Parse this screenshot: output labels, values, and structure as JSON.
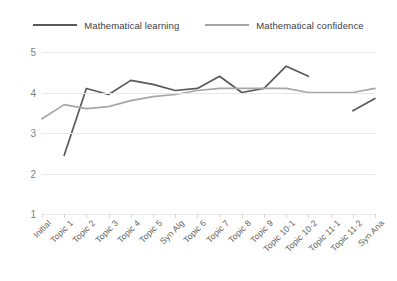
{
  "legend": {
    "position": "top-center",
    "items": [
      {
        "label": "Mathematical learning",
        "color": "#595959",
        "name": "legend-mathematical-learning"
      },
      {
        "label": "Mathematical confidence",
        "color": "#a6a6a6",
        "name": "legend-mathematical-confidence"
      }
    ]
  },
  "chart_data": {
    "type": "line",
    "title": "",
    "xlabel": "",
    "ylabel": "",
    "ylim": [
      1,
      5
    ],
    "yticks": [
      1,
      2,
      3,
      4,
      5
    ],
    "grid": true,
    "categories": [
      "Initial",
      "Topic 1",
      "Topic 2",
      "Topic 3",
      "Topic 4",
      "Topic 5",
      "Syn Alg",
      "Topic 6",
      "Topic 7",
      "Topic 8",
      "Topic 9",
      "Topic 10-1",
      "Topic 10-2",
      "Topic 11-1",
      "Topic 11-2",
      "Syn Ana"
    ],
    "series": [
      {
        "name": "Mathematical learning",
        "color": "#595959",
        "values": [
          null,
          2.45,
          4.1,
          3.95,
          4.3,
          4.2,
          4.05,
          4.1,
          4.4,
          4.0,
          4.1,
          4.65,
          4.4,
          null,
          3.55,
          3.85
        ]
      },
      {
        "name": "Mathematical confidence",
        "color": "#a6a6a6",
        "values": [
          3.35,
          3.7,
          3.6,
          3.65,
          3.8,
          3.9,
          3.95,
          4.05,
          4.1,
          4.1,
          4.1,
          4.1,
          4.0,
          4.0,
          4.0,
          4.1
        ]
      }
    ]
  }
}
